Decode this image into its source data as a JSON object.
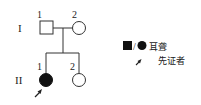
{
  "generations": [
    {
      "label": "I",
      "members": [
        {
          "num": "1",
          "sex": "male",
          "affected": false
        },
        {
          "num": "2",
          "sex": "female",
          "affected": false
        }
      ]
    },
    {
      "label": "II",
      "members": [
        {
          "num": "1",
          "sex": "female",
          "affected": true,
          "proband": true
        },
        {
          "num": "2",
          "sex": "female",
          "affected": false
        }
      ]
    }
  ],
  "legend": {
    "affected_symbols": "■/●",
    "affected_label": "耳聋",
    "proband_label": "先证者"
  }
}
